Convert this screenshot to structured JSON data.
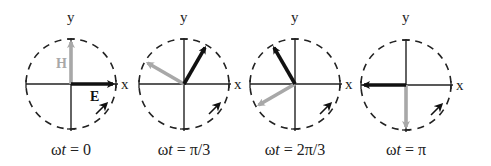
{
  "figure": {
    "colors": {
      "e_field": "#111111",
      "h_field": "#a8a8a8",
      "axes": "#222222",
      "circle": "#222222"
    },
    "axis_labels": {
      "x": "x",
      "y": "y"
    },
    "vector_labels": {
      "e": "E",
      "h": "H"
    },
    "panels": [
      {
        "cx": 71,
        "cy": 84,
        "e_angle_deg": 0,
        "h_angle_deg": 90,
        "caption_prefix": "ωt",
        "caption_value": "= 0",
        "show_vector_labels": true,
        "show_left_x": false
      },
      {
        "cx": 184,
        "cy": 84,
        "e_angle_deg": 60,
        "h_angle_deg": 150,
        "caption_prefix": "ωt",
        "caption_value": "= π/3",
        "show_vector_labels": false,
        "show_left_x": true
      },
      {
        "cx": 295,
        "cy": 84,
        "e_angle_deg": 120,
        "h_angle_deg": 210,
        "caption_prefix": "ωt",
        "caption_value": "= 2π/3",
        "show_vector_labels": false,
        "show_left_x": true
      },
      {
        "cx": 406,
        "cy": 85,
        "e_angle_deg": 180,
        "h_angle_deg": 270,
        "caption_prefix": "ωt",
        "caption_value": "= π",
        "show_vector_labels": false,
        "show_left_x": false
      }
    ],
    "radius": 45
  }
}
